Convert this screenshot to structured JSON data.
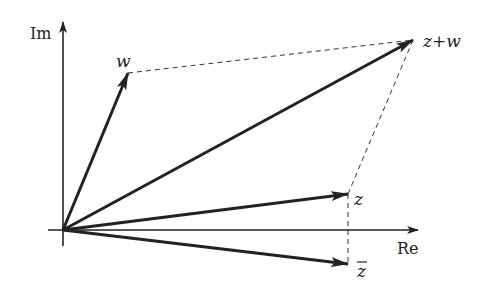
{
  "diagram": {
    "colors": {
      "stroke": "#222222",
      "dashed": "#333333",
      "background": "#ffffff"
    },
    "origin": {
      "x": 63,
      "y": 230
    },
    "axes": {
      "real": {
        "label": "Re",
        "end": {
          "x": 420,
          "y": 230
        },
        "label_pos": {
          "x": 397,
          "y": 254
        }
      },
      "imag": {
        "label": "Im",
        "end": {
          "x": 63,
          "y": 20
        },
        "label_pos": {
          "x": 30,
          "y": 39
        }
      }
    },
    "vectors": [
      {
        "id": "w",
        "label": "w",
        "tip": {
          "x": 128,
          "y": 73
        },
        "label_pos": {
          "x": 116,
          "y": 67
        }
      },
      {
        "id": "z_plus_w",
        "label": "z+w",
        "tip": {
          "x": 413,
          "y": 40
        },
        "label_pos": {
          "x": 423,
          "y": 47
        }
      },
      {
        "id": "z",
        "label": "z",
        "tip": {
          "x": 348,
          "y": 194
        },
        "label_pos": {
          "x": 354,
          "y": 205
        }
      },
      {
        "id": "z_conj",
        "label": "z",
        "overline": true,
        "tip": {
          "x": 348,
          "y": 264
        },
        "label_pos": {
          "x": 356,
          "y": 277
        }
      }
    ],
    "dashed_lines": [
      {
        "from": "w",
        "to": "z_plus_w"
      },
      {
        "from": "z",
        "to": "z_plus_w"
      },
      {
        "from": "z",
        "to": "z_conj"
      }
    ]
  }
}
